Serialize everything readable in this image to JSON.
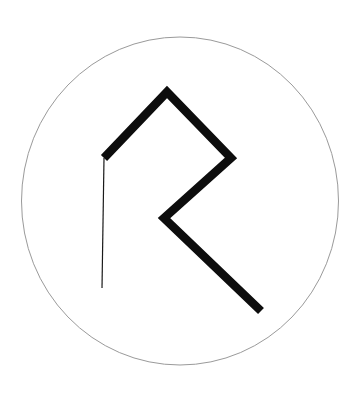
{
  "figure": {
    "canvas": {
      "width": 359,
      "height": 393,
      "background": "#ffffff"
    },
    "colors": {
      "background": "#ffffff",
      "glyph_stroke": "#0d0d0d",
      "thin_stroke": "#1a1a1a",
      "circle_stroke": "#9a9a9a"
    },
    "circle": {
      "label": "enclosing-circle",
      "center_x": 180,
      "center_y": 201,
      "radius": 158.5,
      "radius_y": 164,
      "stroke_width": 1,
      "fill": "none"
    },
    "glyph": {
      "label": "othala-rune",
      "thick_stroke_width": 8.5,
      "thin_stroke_width": 1.2,
      "points": {
        "apex_top": {
          "x": 167,
          "y": 92
        },
        "vertex_left": {
          "x": 104,
          "y": 158
        },
        "vertex_right": {
          "x": 231,
          "y": 158
        },
        "crossing_center": {
          "x": 164,
          "y": 218
        },
        "tail_bottom_left": {
          "x": 102,
          "y": 288
        },
        "tail_bottom_right": {
          "x": 261,
          "y": 311
        }
      },
      "strokes": [
        {
          "name": "thick-upper-left-arm",
          "from": "vertex_left",
          "to": "apex_top",
          "weight": "thick"
        },
        {
          "name": "thick-upper-right-arm",
          "from": "apex_top",
          "to": "vertex_right",
          "weight": "thick"
        },
        {
          "name": "thick-lower-right-arm",
          "from": "vertex_right",
          "to": "crossing_center",
          "weight": "thick"
        },
        {
          "name": "thick-descending-tail",
          "from": "crossing_center",
          "to": "tail_bottom_right",
          "weight": "thick"
        },
        {
          "name": "thin-left-diagonal",
          "from": "vertex_left",
          "to": "tail_bottom_left",
          "weight": "thin"
        }
      ]
    }
  }
}
